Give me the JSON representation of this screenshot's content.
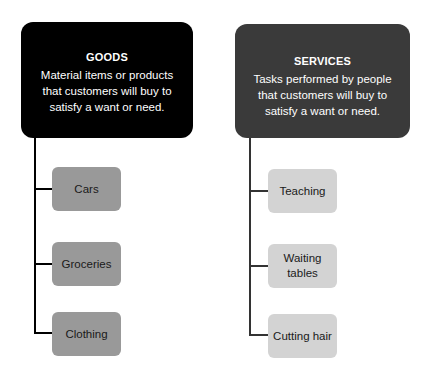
{
  "colors": {
    "goods_header": "#000000",
    "services_header": "#3a3a3a",
    "goods_item": "#999999",
    "services_item": "#d3d3d3",
    "goods_connector": "#000000",
    "services_connector": "#333333"
  },
  "goods": {
    "title": "GOODS",
    "description": "Material items or products that customers will buy to satisfy a want or need.",
    "items": [
      {
        "label": "Cars"
      },
      {
        "label": "Groceries"
      },
      {
        "label": "Clothing"
      }
    ]
  },
  "services": {
    "title": "SERVICES",
    "description": "Tasks performed by people that customers will buy to satisfy a want or need.",
    "items": [
      {
        "label": "Teaching"
      },
      {
        "label": "Waiting tables"
      },
      {
        "label": "Cutting hair"
      }
    ]
  }
}
